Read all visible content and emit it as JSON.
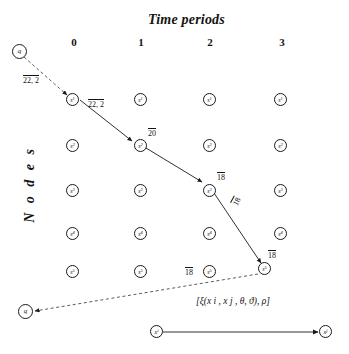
{
  "figure": {
    "title_time": "Time periods",
    "title_nodes": "N o d e s",
    "time_periods": [
      "0",
      "1",
      "2",
      "3"
    ],
    "node_rows": [
      "s",
      "s",
      "s",
      "s",
      "s"
    ],
    "node_subscripts": [
      "1",
      "2",
      "3",
      "4",
      "5"
    ],
    "origin_label": "q",
    "destination_label": "q",
    "edge_labels": {
      "origin_to_s1": "22, 2",
      "s1_to_s2": "22, 2",
      "s2_label": "20",
      "s3_label": "18",
      "diagonal_label": "18",
      "bottom_horizontal": "18",
      "destination_corner": "18"
    },
    "legend": {
      "formula": "[ξ(x i , x j , θ, ϑ), ρ]",
      "from_node": "x",
      "from_sub": "i",
      "to_node": "x",
      "to_sub": "j"
    },
    "colors": {
      "ink": "#141414",
      "dashed": "#4a4a4a",
      "background": "#ffffff"
    }
  }
}
